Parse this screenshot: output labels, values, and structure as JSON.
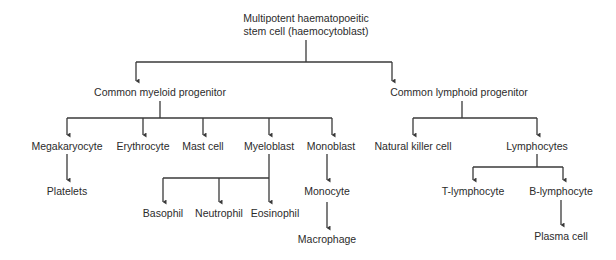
{
  "diagram": {
    "type": "tree",
    "line_color": "#3a3a3a",
    "text_color": "#2b2b2b",
    "nodes": {
      "root_line1": "Multipotent haematopoeitic",
      "root_line2": "stem cell (haemocytoblast)",
      "myeloid": "Common myeloid progenitor",
      "lymphoid": "Common lymphoid progenitor",
      "megakaryocyte": "Megakaryocyte",
      "erythrocyte": "Erythrocyte",
      "mast_cell": "Mast cell",
      "myeloblast": "Myeloblast",
      "monoblast": "Monoblast",
      "platelets": "Platelets",
      "basophil": "Basophil",
      "neutrophil": "Neutrophil",
      "eosinophil": "Eosinophil",
      "monocyte": "Monocyte",
      "macrophage": "Macrophage",
      "nk_cell": "Natural killer cell",
      "lymphocytes": "Lymphocytes",
      "t_lymphocyte": "T-lymphocyte",
      "b_lymphocyte": "B-lymphocyte",
      "plasma_cell": "Plasma cell"
    },
    "edges": [
      [
        "Multipotent haematopoeitic stem cell (haemocytoblast)",
        "Common myeloid progenitor"
      ],
      [
        "Multipotent haematopoeitic stem cell (haemocytoblast)",
        "Common lymphoid progenitor"
      ],
      [
        "Common myeloid progenitor",
        "Megakaryocyte"
      ],
      [
        "Common myeloid progenitor",
        "Erythrocyte"
      ],
      [
        "Common myeloid progenitor",
        "Mast cell"
      ],
      [
        "Common myeloid progenitor",
        "Myeloblast"
      ],
      [
        "Common myeloid progenitor",
        "Monoblast"
      ],
      [
        "Megakaryocyte",
        "Platelets"
      ],
      [
        "Myeloblast",
        "Basophil"
      ],
      [
        "Myeloblast",
        "Neutrophil"
      ],
      [
        "Myeloblast",
        "Eosinophil"
      ],
      [
        "Monoblast",
        "Monocyte"
      ],
      [
        "Monocyte",
        "Macrophage"
      ],
      [
        "Common lymphoid progenitor",
        "Natural killer cell"
      ],
      [
        "Common lymphoid progenitor",
        "Lymphocytes"
      ],
      [
        "Lymphocytes",
        "T-lymphocyte"
      ],
      [
        "Lymphocytes",
        "B-lymphocyte"
      ],
      [
        "B-lymphocyte",
        "Plasma cell"
      ]
    ]
  }
}
